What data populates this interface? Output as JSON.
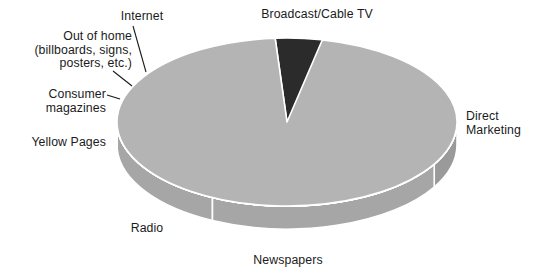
{
  "figure": {
    "title": "",
    "background_color": "#ffffff"
  },
  "labels": {
    "broadcast": "Broadcast/Cable TV",
    "direct": "Direct\nMarketing",
    "newspapers": "Newspapers",
    "radio": "Radio",
    "yellow_pages": "Yellow Pages",
    "consumer_magazines": "Consumer\nmagazines",
    "out_of_home": "Out of home\n(billboards, signs,\nposters, etc.)",
    "internet": "Internet"
  },
  "chart_data": {
    "type": "pie",
    "title": "",
    "subtitle": "",
    "xlabel": "",
    "ylabel": "",
    "legend_position": "none",
    "grid": false,
    "three_d": true,
    "start_angle_deg": -30,
    "direction": "clockwise",
    "geometry": {
      "center_x": 287,
      "center_y": 122,
      "radius_x": 170,
      "radius_y": 84,
      "depth": 23,
      "separator_color": "#ffffff",
      "separator_width": 1.6
    },
    "categories": [
      "Broadcast/Cable TV",
      "Direct Marketing",
      "Newspapers",
      "Radio",
      "Yellow Pages",
      "Consumer magazines",
      "Out of home (billboards, signs, posters, etc.)",
      "Internet"
    ],
    "values": [
      30,
      24,
      17,
      9,
      8,
      6,
      3.5,
      2.5
    ],
    "unit": "percent",
    "slices": [
      {
        "name": "Broadcast/Cable TV",
        "value": 30,
        "start_angle_deg": -30,
        "end_angle_deg": 78,
        "top_color": "#050505",
        "side_color": "#9a9a9a",
        "label_key": "broadcast",
        "leader_line": false
      },
      {
        "name": "Direct Marketing",
        "value": 24,
        "start_angle_deg": -116,
        "end_angle_deg": -30,
        "top_color": "#0d0d0d",
        "side_color": "#a6a6a6",
        "label_key": "direct",
        "leader_line": false
      },
      {
        "name": "Newspapers",
        "value": 17,
        "start_angle_deg": -177,
        "end_angle_deg": -116,
        "top_color": "#8b8b8b",
        "side_color": "#a6a6a6",
        "label_key": "newspapers",
        "leader_line": false
      },
      {
        "name": "Radio",
        "value": 9,
        "start_angle_deg": 151,
        "end_angle_deg": 183,
        "top_color": "#3c3c3c",
        "side_color": "#a2a2a2",
        "label_key": "radio",
        "leader_line": false
      },
      {
        "name": "Yellow Pages",
        "value": 8,
        "start_angle_deg": 123,
        "end_angle_deg": 151,
        "top_color": "#c2c2c2",
        "side_color": "#acacac",
        "label_key": "yellow_pages",
        "leader_line": false
      },
      {
        "name": "Consumer magazines",
        "value": 6,
        "start_angle_deg": 104,
        "end_angle_deg": 123,
        "top_color": "#8e8e8e",
        "side_color": "#a2a2a2",
        "label_key": "consumer_magazines",
        "leader_line": true
      },
      {
        "name": "Out of home (billboards, signs, posters, etc.)",
        "value": 3.5,
        "start_angle_deg": 94,
        "end_angle_deg": 104,
        "top_color": "#2b2b2b",
        "side_color": "#9a9a9a",
        "label_key": "out_of_home",
        "leader_line": true
      },
      {
        "name": "Internet",
        "value": 2.5,
        "start_angle_deg": 78,
        "end_angle_deg": 94,
        "top_color": "#b4b4b4",
        "side_color": "#a6a6a6",
        "label_key": "internet",
        "leader_line": true
      }
    ],
    "leader_lines": [
      {
        "name": "internet-leader",
        "x1": 133,
        "y1": 26,
        "x2": 146,
        "y2": 72
      },
      {
        "name": "outofhome-leader",
        "x1": 113,
        "y1": 71,
        "x2": 132,
        "y2": 86
      },
      {
        "name": "consumer-leader",
        "x1": 107,
        "y1": 95,
        "x2": 120,
        "y2": 99
      }
    ]
  }
}
